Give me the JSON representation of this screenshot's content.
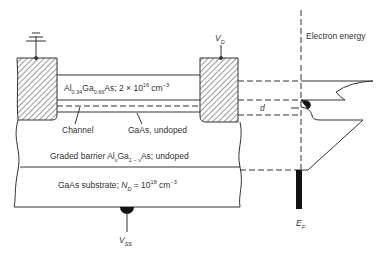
{
  "diagram": {
    "layers": {
      "algaas": {
        "pre": "Al",
        "s1": "0.34",
        "mid": "Ga",
        "s2": "0.66",
        "post": "As; 2 × 10",
        "exp": "16",
        "unit": " cm",
        "uexp": "−3"
      },
      "channel": "Channel",
      "gaas_undoped": "GaAs, undoped",
      "graded": {
        "pre": "Graded barrier Al",
        "s1": "x",
        "mid": "Ga",
        "s2": "1 − x",
        "post": "As; undoped"
      },
      "substrate": {
        "pre": "GaAs substrate; ",
        "nd": "N",
        "nds": "D",
        "post": " = 10",
        "exp": "18",
        "unit": " cm",
        "uexp": "−3"
      }
    },
    "terminals": {
      "drain": {
        "v": "V",
        "s": "D"
      },
      "substrate": {
        "v": "V",
        "s": "SS"
      }
    },
    "band": {
      "axis_label": "Electron energy",
      "d_label": "d",
      "fermi": {
        "v": "E",
        "s": "F"
      }
    }
  }
}
